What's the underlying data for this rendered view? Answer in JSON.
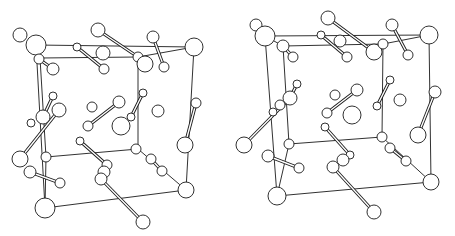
{
  "figure": {
    "type": "stereo-pair",
    "colors": {
      "line": "#1a1a1a",
      "background": "#ffffff",
      "atom_fill": "#ffffff"
    }
  },
  "panels": [
    {
      "name": "left-view",
      "cell_edges": [
        [
          36,
          45,
          194,
          47
        ],
        [
          194,
          47,
          186,
          190
        ],
        [
          186,
          190,
          45,
          208
        ],
        [
          45,
          208,
          36,
          45
        ],
        [
          40,
          58,
          138,
          57
        ],
        [
          138,
          57,
          138,
          149
        ],
        [
          138,
          149,
          46,
          157
        ],
        [
          46,
          157,
          40,
          58
        ],
        [
          36,
          45,
          40,
          58
        ],
        [
          194,
          47,
          138,
          57
        ],
        [
          186,
          190,
          138,
          149
        ],
        [
          45,
          208,
          46,
          157
        ]
      ],
      "bonds": [
        [
          98,
          30,
          138,
          57
        ],
        [
          77,
          47,
          104,
          69
        ],
        [
          153,
          37,
          164,
          67
        ],
        [
          39,
          59,
          53,
          69
        ],
        [
          53,
          96,
          43,
          117
        ],
        [
          59,
          110,
          20,
          159
        ],
        [
          88,
          126,
          119,
          102
        ],
        [
          143,
          93,
          131,
          117
        ],
        [
          196,
          103,
          185,
          145
        ],
        [
          30,
          172,
          60,
          183
        ],
        [
          80,
          141,
          107,
          165
        ],
        [
          101,
          179,
          143,
          222
        ],
        [
          151,
          159,
          162,
          171
        ]
      ],
      "atoms": [
        [
          20,
          35,
          7
        ],
        [
          36,
          45,
          10
        ],
        [
          39,
          59,
          5
        ],
        [
          53,
          69,
          6
        ],
        [
          98,
          30,
          7
        ],
        [
          77,
          47,
          4
        ],
        [
          103,
          53,
          7
        ],
        [
          104,
          69,
          5
        ],
        [
          138,
          57,
          5
        ],
        [
          145,
          64,
          8
        ],
        [
          153,
          37,
          6
        ],
        [
          164,
          67,
          5
        ],
        [
          194,
          47,
          9
        ],
        [
          53,
          96,
          4
        ],
        [
          59,
          110,
          7
        ],
        [
          43,
          117,
          7
        ],
        [
          31,
          123,
          4
        ],
        [
          92,
          107,
          5
        ],
        [
          119,
          102,
          6
        ],
        [
          88,
          126,
          5
        ],
        [
          121,
          126,
          9
        ],
        [
          143,
          93,
          4
        ],
        [
          131,
          117,
          4
        ],
        [
          158,
          111,
          6
        ],
        [
          196,
          103,
          5
        ],
        [
          185,
          145,
          8
        ],
        [
          20,
          159,
          8
        ],
        [
          46,
          157,
          5
        ],
        [
          30,
          172,
          6
        ],
        [
          60,
          183,
          5
        ],
        [
          80,
          141,
          4
        ],
        [
          107,
          165,
          5
        ],
        [
          104,
          172,
          6
        ],
        [
          101,
          179,
          6
        ],
        [
          136,
          149,
          5
        ],
        [
          151,
          159,
          5
        ],
        [
          162,
          171,
          5
        ],
        [
          186,
          190,
          8
        ],
        [
          45,
          208,
          10
        ],
        [
          143,
          222,
          7
        ]
      ]
    },
    {
      "name": "right-view",
      "cell_edges": [
        [
          265,
          36,
          429,
          35
        ],
        [
          429,
          35,
          431,
          182
        ],
        [
          431,
          182,
          277,
          196
        ],
        [
          277,
          196,
          265,
          36
        ],
        [
          283,
          46,
          383,
          44
        ],
        [
          383,
          44,
          382,
          137
        ],
        [
          382,
          137,
          289,
          144
        ],
        [
          289,
          144,
          283,
          46
        ],
        [
          265,
          36,
          283,
          46
        ],
        [
          429,
          35,
          383,
          44
        ],
        [
          431,
          182,
          382,
          137
        ],
        [
          277,
          196,
          289,
          144
        ]
      ],
      "bonds": [
        [
          328,
          18,
          374,
          52
        ],
        [
          321,
          35,
          347,
          57
        ],
        [
          392,
          25,
          408,
          55
        ],
        [
          283,
          46,
          293,
          57
        ],
        [
          297,
          84,
          290,
          98
        ],
        [
          290,
          98,
          244,
          145
        ],
        [
          327,
          113,
          357,
          90
        ],
        [
          390,
          80,
          377,
          106
        ],
        [
          435,
          92,
          418,
          135
        ],
        [
          268,
          156,
          299,
          168
        ],
        [
          325,
          127,
          350,
          155
        ],
        [
          333,
          167,
          374,
          212
        ],
        [
          390,
          148,
          406,
          161
        ]
      ],
      "atoms": [
        [
          256,
          25,
          6
        ],
        [
          265,
          36,
          10
        ],
        [
          283,
          46,
          6
        ],
        [
          293,
          57,
          5
        ],
        [
          328,
          18,
          7
        ],
        [
          321,
          35,
          4
        ],
        [
          340,
          41,
          6
        ],
        [
          347,
          57,
          5
        ],
        [
          374,
          52,
          8
        ],
        [
          383,
          44,
          5
        ],
        [
          392,
          25,
          6
        ],
        [
          408,
          55,
          5
        ],
        [
          429,
          35,
          9
        ],
        [
          297,
          84,
          4
        ],
        [
          290,
          98,
          7
        ],
        [
          280,
          105,
          5
        ],
        [
          273,
          112,
          4
        ],
        [
          335,
          95,
          5
        ],
        [
          357,
          90,
          6
        ],
        [
          327,
          113,
          5
        ],
        [
          352,
          115,
          9
        ],
        [
          390,
          80,
          4
        ],
        [
          377,
          106,
          4
        ],
        [
          400,
          100,
          6
        ],
        [
          435,
          92,
          6
        ],
        [
          418,
          135,
          8
        ],
        [
          244,
          145,
          8
        ],
        [
          289,
          144,
          5
        ],
        [
          268,
          156,
          6
        ],
        [
          299,
          168,
          5
        ],
        [
          325,
          127,
          4
        ],
        [
          350,
          155,
          4
        ],
        [
          343,
          160,
          6
        ],
        [
          333,
          167,
          6
        ],
        [
          382,
          137,
          5
        ],
        [
          390,
          148,
          5
        ],
        [
          406,
          161,
          5
        ],
        [
          431,
          182,
          8
        ],
        [
          277,
          196,
          9
        ],
        [
          374,
          212,
          7
        ]
      ]
    }
  ]
}
